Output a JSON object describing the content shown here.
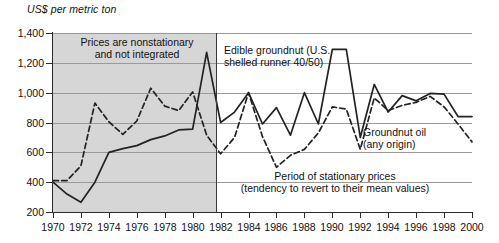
{
  "chart_data": {
    "type": "line",
    "title": "",
    "ylabel": "US$ per metric ton",
    "xlabel": "",
    "ylim": [
      200,
      1400
    ],
    "xlim": [
      1970,
      2000
    ],
    "yticks": [
      "200",
      "400",
      "600",
      "800",
      "1,000",
      "1,200",
      "1,400"
    ],
    "ytick_values": [
      200,
      400,
      600,
      800,
      1000,
      1200,
      1400
    ],
    "xticks": [
      "1970",
      "1972",
      "1974",
      "1976",
      "1978",
      "1980",
      "1982",
      "1984",
      "1986",
      "1988",
      "1990",
      "1992",
      "1994",
      "1996",
      "1998",
      "2000"
    ],
    "xtick_values": [
      1970,
      1972,
      1974,
      1976,
      1978,
      1980,
      1982,
      1984,
      1986,
      1988,
      1990,
      1992,
      1994,
      1996,
      1998,
      2000
    ],
    "grid": true,
    "legend": "inline-annotations",
    "x": [
      1970,
      1971,
      1972,
      1973,
      1974,
      1975,
      1976,
      1977,
      1978,
      1979,
      1980,
      1981,
      1982,
      1983,
      1984,
      1985,
      1986,
      1987,
      1988,
      1989,
      1990,
      1991,
      1992,
      1993,
      1994,
      1995,
      1996,
      1997,
      1998,
      1999,
      2000
    ],
    "series": [
      {
        "name": "Edible groundnut (U.S. shelled runner 40/50)",
        "style": "solid",
        "color": "#222222",
        "values": [
          400,
          320,
          265,
          400,
          600,
          625,
          645,
          685,
          710,
          750,
          755,
          1270,
          800,
          870,
          1000,
          790,
          900,
          715,
          1000,
          790,
          1290,
          1290,
          700,
          1055,
          870,
          980,
          945,
          995,
          990,
          840,
          840
        ]
      },
      {
        "name": "Groundnut oil (any origin)",
        "style": "dashed",
        "color": "#222222",
        "values": [
          410,
          410,
          510,
          930,
          805,
          720,
          810,
          1030,
          910,
          880,
          1005,
          715,
          590,
          700,
          1000,
          705,
          500,
          580,
          620,
          730,
          905,
          890,
          620,
          965,
          880,
          915,
          935,
          975,
          905,
          790,
          670
        ]
      }
    ],
    "annotations": [
      {
        "id": "nonstationary",
        "text": "Prices are nonstationary\nand not integrated"
      },
      {
        "id": "edible",
        "text": "Edible groundnut (U.S.\nshelled runner 40/50)"
      },
      {
        "id": "oil",
        "text": "Groundnut oil\n(any origin)"
      },
      {
        "id": "stationary",
        "text": "Period of stationary prices\n(tendency to revert to their mean values)"
      }
    ],
    "shaded_region": {
      "from": 1970,
      "to": 1981.7,
      "color": "#d6d6d6",
      "meaning": "nonstationary period"
    }
  },
  "labels": {
    "y_axis_title": "US$ per metric ton",
    "ann_nonstationary_line1": "Prices are nonstationary",
    "ann_nonstationary_line2": "and not integrated",
    "ann_edible_line1": "Edible groundnut (U.S.",
    "ann_edible_line2": "shelled runner 40/50)",
    "ann_oil_line1": "Groundnut oil",
    "ann_oil_line2": "(any origin)",
    "ann_stationary_line1": "Period of stationary prices",
    "ann_stationary_line2": "(tendency to revert to their mean values)"
  }
}
